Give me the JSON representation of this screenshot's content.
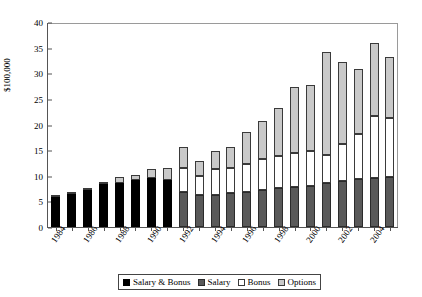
{
  "chart_data": {
    "type": "bar",
    "stacked": true,
    "title": "",
    "xlabel": "",
    "ylabel": "$100,000",
    "ylim": [
      0,
      40
    ],
    "yticks": [
      0,
      5,
      10,
      15,
      20,
      25,
      30,
      35,
      40
    ],
    "grid": false,
    "legend_position": "bottom",
    "categories": [
      "1984",
      "1985",
      "1986",
      "1987",
      "1988",
      "1989",
      "1990",
      "1991",
      "1992",
      "1993",
      "1994",
      "1995",
      "1996",
      "1997",
      "1998",
      "1999",
      "2000",
      "2001",
      "2002",
      "2003",
      "2004",
      "2005"
    ],
    "visible_tick_labels": [
      "1984",
      "1986",
      "1988",
      "1990",
      "1992",
      "1994",
      "1996",
      "1998",
      "2000",
      "2002",
      "2004"
    ],
    "series": [
      {
        "name": "Salary & Bonus",
        "color": "#000000",
        "values": [
          5.9,
          6.5,
          7.3,
          8.3,
          8.6,
          9.1,
          9.5,
          9.2,
          0,
          0,
          0,
          0,
          0,
          0,
          0,
          0,
          0,
          0,
          0,
          0,
          0,
          0
        ]
      },
      {
        "name": "Salary",
        "color": "#595959",
        "values": [
          0,
          0,
          0,
          0,
          0,
          0,
          0,
          0,
          6.9,
          6.3,
          6.3,
          6.6,
          6.9,
          7.2,
          7.6,
          7.9,
          8.1,
          8.5,
          8.9,
          9.4,
          9.5,
          9.8
        ]
      },
      {
        "name": "Bonus",
        "color": "#ffffff",
        "values": [
          0,
          0,
          0,
          0,
          0,
          0,
          0,
          0,
          4.6,
          3.6,
          5.0,
          4.9,
          5.3,
          6.1,
          6.3,
          6.6,
          6.7,
          5.5,
          7.3,
          8.8,
          12.2,
          11.4
        ]
      },
      {
        "name": "Options",
        "color": "#c9c9c9",
        "values": [
          0.1,
          0.2,
          0.3,
          0.5,
          1.2,
          1.1,
          1.8,
          2.4,
          4.2,
          2.9,
          3.5,
          4.2,
          6.3,
          7.3,
          9.3,
          12.8,
          13.0,
          20.1,
          16.0,
          12.7,
          14.3,
          12.0
        ]
      }
    ],
    "totals": [
      6.0,
      6.7,
      7.6,
      8.8,
      9.8,
      10.2,
      11.3,
      11.6,
      15.7,
      12.8,
      14.8,
      15.7,
      18.5,
      20.6,
      23.2,
      27.3,
      27.8,
      34.1,
      32.2,
      30.9,
      36.0,
      33.2
    ]
  },
  "legend": {
    "items": [
      {
        "label": "Salary & Bonus",
        "swatch": "sw-sb"
      },
      {
        "label": "Salary",
        "swatch": "sw-sal"
      },
      {
        "label": "Bonus",
        "swatch": "sw-bon"
      },
      {
        "label": "Options",
        "swatch": "sw-opt"
      }
    ]
  }
}
